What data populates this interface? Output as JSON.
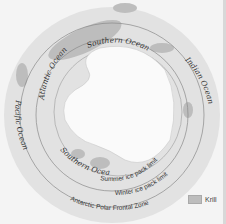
{
  "map": {
    "labels": {
      "atlantic": "Atlantic Ocean",
      "southern_top": "Southern Ocean",
      "indian": "Indian Ocean",
      "pacific": "Pacific Ocean",
      "southern_bottom": "Southern Ocean",
      "summer_limit": "Summer ice pack limit",
      "winter_limit": "Winter ice pack limit",
      "polar_front": "Antarctic Polar Frontal Zone"
    },
    "legend": {
      "krill_label": "Krill"
    },
    "colors": {
      "background": "#f4f4f4",
      "ocean_ring": "#e2e2e2",
      "krill": "#bdbdbd",
      "continent": "#fafafa",
      "lines": "#8a8a8a"
    }
  }
}
